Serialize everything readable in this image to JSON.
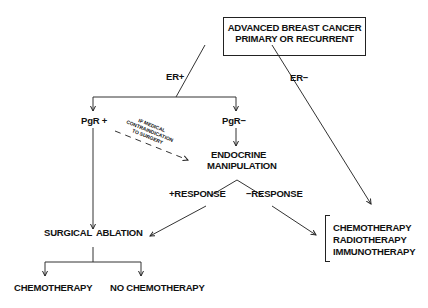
{
  "diagram": {
    "root": {
      "line1": "ADVANCED BREAST CANCER",
      "line2": "PRIMARY OR RECURRENT"
    },
    "edges": {
      "er_pos": "ER+",
      "er_neg": "ER−",
      "pos_response": "+RESPONSE",
      "neg_response": "−RESPONSE"
    },
    "nodes": {
      "pgr_pos": "PgR +",
      "pgr_neg": "PgR−",
      "endocrine_line1": "ENDOCRINE",
      "endocrine_line2": "MANIPULATION",
      "surgical_ablation": "SURGICAL  ABLATION",
      "chemotherapy": "CHEMOTHERAPY",
      "no_chemotherapy": "NO CHEMOTHERAPY"
    },
    "note": {
      "line1": "IF MEDICAL",
      "line2": "CONTRAINDICATION",
      "line3": "TO SURGERY"
    },
    "therapies": [
      "CHEMOTHERAPY",
      "RADIOTHERAPY",
      "IMMUNOTHERAPY"
    ]
  }
}
